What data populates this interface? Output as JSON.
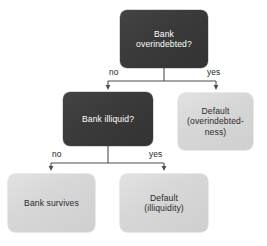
{
  "diagram": {
    "background_color": "#ffffff",
    "decision_node_color": "#3a3a3a",
    "terminal_node_color": "#d7d7d7",
    "connector_color": "#4d4d4d",
    "nodes": [
      {
        "id": "bank-overindebted",
        "type": "decision",
        "text": "Bank\noverindebted?"
      },
      {
        "id": "bank-illiquid",
        "type": "decision",
        "text": "Bank illiquid?"
      },
      {
        "id": "default-overindebtedness",
        "type": "terminal",
        "text": "Default\n(overindebted-\nness)"
      },
      {
        "id": "bank-survives",
        "type": "terminal",
        "text": "Bank survives"
      },
      {
        "id": "default-illiquidity",
        "type": "terminal",
        "text": "Default\n(illiquidity)"
      }
    ],
    "edge_labels": {
      "overindebted_no": "no",
      "overindebted_yes": "yes",
      "illiquid_no": "no",
      "illiquid_yes": "yes"
    }
  }
}
